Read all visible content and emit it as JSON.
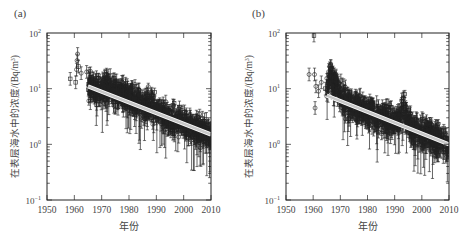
{
  "chart_data": [
    {
      "panel_label": "(a)",
      "type": "scatter",
      "title": "",
      "xlabel": "年份",
      "ylabel": "在表层海水中的浓度/(Bq/m³)",
      "ylabel_main": "在表层海水中的浓度/(Bq/m",
      "ylabel_sup": "3",
      "ylabel_end": ")",
      "xlim": [
        1950,
        2010
      ],
      "ylim": [
        0.1,
        100
      ],
      "yscale": "log",
      "xticks": [
        "1950",
        "1960",
        "1970",
        "1980",
        "1990",
        "2000",
        "2010"
      ],
      "yticks": [
        {
          "base": "10",
          "exp": "2"
        },
        {
          "base": "10",
          "exp": "1"
        },
        {
          "base": "10",
          "exp": "0"
        },
        {
          "base": "10",
          "exp": "−1"
        }
      ],
      "grid": false,
      "legend": null,
      "series": [
        {
          "name": "measurements",
          "marker": "circle/square with error bars",
          "x_range": [
            1958,
            2010
          ],
          "early_points": [
            [
              1958.5,
              15
            ],
            [
              1960.5,
              13
            ],
            [
              1960.8,
              22
            ],
            [
              1961,
              32
            ],
            [
              1961.2,
              42
            ],
            [
              1961.5,
              25
            ],
            [
              1962.5,
              19
            ],
            [
              1964.5,
              20
            ]
          ],
          "density_note": "dense cloud 1965-2010 scattered around fit"
        },
        {
          "name": "fit",
          "type": "line",
          "color": "#c8c8c8",
          "x": [
            1965,
            2010
          ],
          "y": [
            11,
            1.5
          ]
        }
      ]
    },
    {
      "panel_label": "(b)",
      "type": "scatter",
      "title": "",
      "xlabel": "年份",
      "ylabel": "在表层海水中的浓度/(Bq/m³)",
      "ylabel_main": "在表层海水中的浓度/(Bq/m",
      "ylabel_sup": "3",
      "ylabel_end": ")",
      "xlim": [
        1950,
        2010
      ],
      "ylim": [
        0.1,
        100
      ],
      "yscale": "log",
      "xticks": [
        "1950",
        "1960",
        "1970",
        "1980",
        "1990",
        "2000",
        "2010"
      ],
      "yticks": [
        {
          "base": "10",
          "exp": "2"
        },
        {
          "base": "10",
          "exp": "1"
        },
        {
          "base": "10",
          "exp": "0"
        },
        {
          "base": "10",
          "exp": "−1"
        }
      ],
      "grid": false,
      "legend": null,
      "series": [
        {
          "name": "measurements",
          "marker": "circle/square with error bars",
          "x_range": [
            1958,
            2010
          ],
          "early_points": [
            [
              1958.5,
              18
            ],
            [
              1960.3,
              90
            ],
            [
              1960.5,
              18
            ],
            [
              1960.7,
              4.5
            ],
            [
              1961,
              11
            ],
            [
              1962,
              9
            ],
            [
              1963,
              13
            ],
            [
              1964.5,
              10
            ]
          ],
          "density_note": "dense cloud 1965-2010 with bump ~1993"
        },
        {
          "name": "fit",
          "type": "line",
          "color": "#c8c8c8",
          "x": [
            1965,
            2010
          ],
          "y": [
            7.5,
            1.0
          ]
        }
      ]
    }
  ],
  "panels": [
    {
      "label": "(a)",
      "xlabel": "年份",
      "ylabel": "在表层海水中的浓度/(Bq/m³)"
    },
    {
      "label": "(b)",
      "xlabel": "年份",
      "ylabel": "在表层海水中的浓度/(Bq/m³)"
    }
  ]
}
